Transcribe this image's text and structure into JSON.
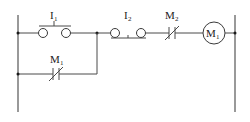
{
  "diagram": {
    "type": "ladder-logic",
    "colors": {
      "wire": "#4a4a4a",
      "background": "#ffffff",
      "text": "#222222"
    },
    "rails": {
      "left_x": 18,
      "right_x": 235,
      "top_y": 15,
      "bottom_y": 112
    },
    "rungs": [
      {
        "y": 33,
        "elements": [
          {
            "id": "I1",
            "kind": "push-button-normally-open",
            "label": "I",
            "subscript": "1"
          },
          {
            "id": "I2",
            "kind": "push-button-normally-closed",
            "label": "I",
            "subscript": "2"
          },
          {
            "id": "M2",
            "kind": "contact-normally-closed",
            "label": "M",
            "subscript": "2"
          },
          {
            "id": "M1-coil",
            "kind": "coil",
            "label": "M",
            "subscript": "1"
          }
        ]
      },
      {
        "y": 74,
        "elements": [
          {
            "id": "M1-contact",
            "kind": "contact-normally-closed",
            "label": "M",
            "subscript": "1"
          }
        ]
      }
    ],
    "labels": {
      "i1": "I",
      "i1_sub": "1",
      "i2": "I",
      "i2_sub": "2",
      "m2": "M",
      "m2_sub": "2",
      "coil": "M",
      "coil_sub": "1",
      "m1": "M",
      "m1_sub": "1"
    }
  }
}
